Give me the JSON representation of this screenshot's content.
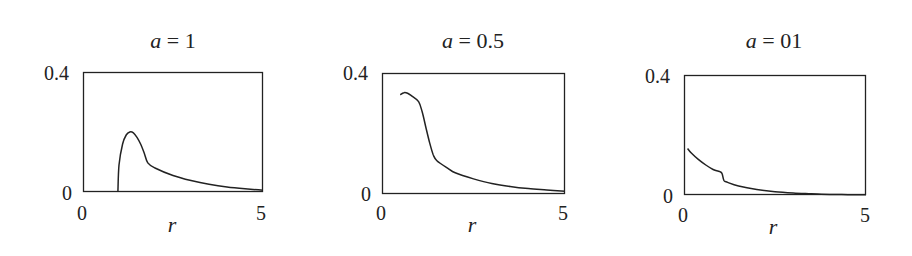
{
  "figure": {
    "panels": [
      {
        "title_var": "a",
        "title_eq": " = ",
        "title_val": "1",
        "ylabel_top": "0.4",
        "ylabel_bottom": "0",
        "xlabel_left": "0",
        "xlabel_right": "5",
        "xlabel": "r"
      },
      {
        "title_var": "a",
        "title_eq": " = ",
        "title_val": "0.5",
        "ylabel_top": "0.4",
        "ylabel_bottom": "0",
        "xlabel_left": "0",
        "xlabel_right": "5",
        "xlabel": "r"
      },
      {
        "title_var": "a",
        "title_eq": " = ",
        "title_val": "01",
        "ylabel_top": "0.4",
        "ylabel_bottom": "0",
        "xlabel_left": "0",
        "xlabel_right": "5",
        "xlabel": "r"
      }
    ],
    "line_color": "#222222"
  },
  "chart_data": [
    {
      "type": "line",
      "title": "a = 1",
      "xlabel": "r",
      "ylabel": "",
      "xlim": [
        0,
        5
      ],
      "ylim": [
        0,
        0.4
      ],
      "xticks": [
        0,
        5
      ],
      "yticks": [
        0,
        0.4
      ],
      "grid": false,
      "x": [
        0.97,
        1.0,
        1.1,
        1.2,
        1.3,
        1.4,
        1.5,
        1.6,
        1.7,
        1.8,
        2.0,
        2.5,
        3.0,
        3.5,
        4.0,
        4.5,
        5.0
      ],
      "values": [
        0.0,
        0.09,
        0.16,
        0.19,
        0.2,
        0.197,
        0.182,
        0.16,
        0.13,
        0.097,
        0.08,
        0.055,
        0.038,
        0.026,
        0.017,
        0.011,
        0.006
      ]
    },
    {
      "type": "line",
      "title": "a = 0.5",
      "xlabel": "r",
      "ylabel": "",
      "xlim": [
        0,
        5
      ],
      "ylim": [
        0,
        0.4
      ],
      "xticks": [
        0,
        5
      ],
      "yticks": [
        0,
        0.4
      ],
      "grid": false,
      "x": [
        0.5,
        0.6,
        0.7,
        0.8,
        1.0,
        1.1,
        1.2,
        1.3,
        1.4,
        1.5,
        1.8,
        2.0,
        2.5,
        3.0,
        3.5,
        4.0,
        4.5,
        5.0
      ],
      "values": [
        0.328,
        0.335,
        0.333,
        0.325,
        0.305,
        0.27,
        0.22,
        0.17,
        0.13,
        0.11,
        0.085,
        0.07,
        0.05,
        0.035,
        0.025,
        0.018,
        0.013,
        0.009
      ]
    },
    {
      "type": "line",
      "title": "a = 01",
      "xlabel": "r",
      "ylabel": "",
      "xlim": [
        0,
        5
      ],
      "ylim": [
        0,
        0.4
      ],
      "xticks": [
        0,
        5
      ],
      "yticks": [
        0,
        0.4
      ],
      "grid": false,
      "x": [
        0.1,
        0.2,
        0.4,
        0.6,
        0.8,
        1.0,
        1.05,
        1.1,
        1.2,
        1.5,
        2.0,
        2.5,
        3.0,
        3.5,
        4.0,
        4.5,
        5.0
      ],
      "values": [
        0.155,
        0.14,
        0.118,
        0.1,
        0.085,
        0.077,
        0.07,
        0.048,
        0.042,
        0.03,
        0.018,
        0.011,
        0.007,
        0.004,
        0.002,
        0.001,
        0.0005
      ]
    }
  ]
}
